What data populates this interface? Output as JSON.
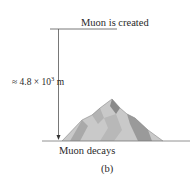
{
  "labels": {
    "created": "Muon is created",
    "distance_prefix": "≈ 4.8 × 10",
    "distance_exponent": "3",
    "distance_unit": " m",
    "decays": "Muon decays",
    "part": "(b)"
  },
  "colors": {
    "line": "#555555",
    "ground": "#777777",
    "mountain_light": "#c9c9c9",
    "mountain_mid": "#a9a9a9",
    "mountain_dark": "#8a8a8a",
    "text": "#2a2a2a"
  }
}
